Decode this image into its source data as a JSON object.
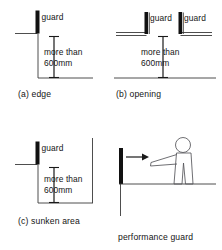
{
  "figure": {
    "panels": [
      {
        "id": "a",
        "caption": "(a) edge",
        "guard_label": "guard",
        "dimension_line1": "more than",
        "dimension_line2": "600mm",
        "dimension_value": "600",
        "dimension_unit": "mm",
        "dimension_qualifier": "more than"
      },
      {
        "id": "b",
        "caption": "(b) opening",
        "guard_label_left": "guard",
        "guard_label_right": "guard",
        "dimension_line1": "more than",
        "dimension_line2": "600mm",
        "dimension_value": "600",
        "dimension_unit": "mm",
        "dimension_qualifier": "more than"
      },
      {
        "id": "c",
        "caption": "(c) sunken area",
        "guard_label": "guard",
        "dimension_line1": "more than",
        "dimension_line2": "600mm",
        "dimension_value": "600",
        "dimension_unit": "mm",
        "dimension_qualifier": "more than"
      },
      {
        "id": "d",
        "caption": "performance guard",
        "figure_description": "person-reaching-over-guard"
      }
    ],
    "colors": {
      "guard_fill": "#111111",
      "line": "#3a3a3a",
      "figure_line": "#55555a",
      "text": "#141414",
      "background": "#ffffff"
    }
  }
}
